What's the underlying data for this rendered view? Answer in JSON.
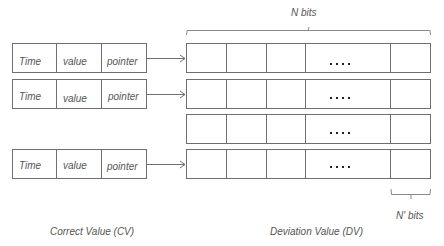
{
  "diagram": {
    "top_brace_label": "N  bits",
    "bottom_brace_label": "N' bits",
    "cv_caption": "Correct Value (CV)",
    "dv_caption": "Deviation Value (DV)",
    "cv_rows": [
      {
        "cells": [
          "Time",
          "value",
          "pointer"
        ]
      },
      {
        "cells": [
          "Time",
          "value",
          "pointer"
        ]
      },
      {
        "cells": [
          "Time",
          "value",
          "pointer"
        ]
      }
    ],
    "dv_rows_count": 4,
    "dv_ellipsis": "••••",
    "colors": {
      "line": "#6f6f6f",
      "text": "#555555",
      "dots": "#222222"
    }
  }
}
